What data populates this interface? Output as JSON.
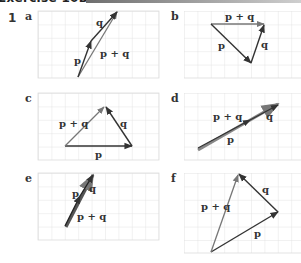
{
  "header": {
    "title": "Exercise 10B?",
    "bar_color_start": "#6e6e6e",
    "bar_color_end": "#cfcfcf"
  },
  "question_number": "1",
  "colors": {
    "grid": "#dcdcdc",
    "vector": "#333333",
    "resultant": "#777777"
  },
  "parts": [
    {
      "label": "a",
      "vectors": {
        "p": "p",
        "q": "q",
        "sum": "p + q"
      }
    },
    {
      "label": "b",
      "vectors": {
        "p": "p",
        "q": "q",
        "sum": "p + q"
      }
    },
    {
      "label": "c",
      "vectors": {
        "p": "p",
        "q": "q",
        "sum": "p + q"
      }
    },
    {
      "label": "d",
      "vectors": {
        "p": "p",
        "q": "q",
        "sum": "p + q"
      }
    },
    {
      "label": "e",
      "vectors": {
        "p": "p",
        "q": "q",
        "sum": "p + q"
      }
    },
    {
      "label": "f",
      "vectors": {
        "p": "p",
        "q": "q",
        "sum": "p + q"
      }
    }
  ]
}
